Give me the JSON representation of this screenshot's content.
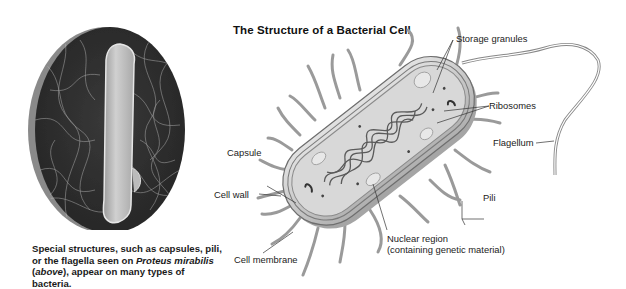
{
  "photo": {
    "subject": "Proteus mirabilis micrograph",
    "caption": {
      "part1": "Special structures, such as capsules, pili, or the flagella seen on ",
      "italic1": "Proteus mirabilis",
      "part2": " (",
      "italic2": "above",
      "part3": "), appear on many types of bacteria."
    }
  },
  "diagram": {
    "title": "The Structure of a Bacterial Cell",
    "labels": {
      "storage_granules": "Storage granules",
      "ribosomes": "Ribosomes",
      "flagellum": "Flagellum",
      "capsule": "Capsule",
      "cell_wall": "Cell wall",
      "pili": "Pili",
      "nuclear_region_line1": "Nuclear region",
      "nuclear_region_line2": "(containing genetic material)",
      "cell_membrane": "Cell membrane"
    }
  },
  "colors": {
    "background": "#ffffff",
    "text": "#222222",
    "photo_dark": "#2e2e2e",
    "cell_body": "#c8c8c8"
  }
}
